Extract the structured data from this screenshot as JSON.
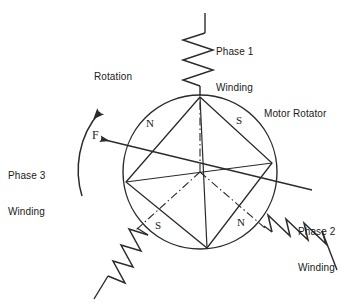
{
  "diagram": {
    "stroke_color": "#2b2b2b",
    "text_color": "#1a1a1a",
    "background": "#ffffff",
    "labels": {
      "phase1": "Phase 1\nWinding",
      "phase1_line1": "Phase 1",
      "phase1_line2": "Winding",
      "phase2_line1": "Phase 2",
      "phase2_line2": "Winding",
      "phase3_line1": "Phase 3",
      "phase3_line2": "Winding",
      "rotation": "Rotation",
      "force": "F",
      "rotator": "Motor Rotator"
    },
    "poles": {
      "north_upper_left": "N",
      "south_upper_right": "S",
      "south_lower_left": "S",
      "north_lower_right": "N"
    },
    "rotor": {
      "center_x": 200,
      "center_y": 172,
      "radius": 77,
      "vertices": [
        {
          "name": "top",
          "x": 200,
          "y": 97
        },
        {
          "name": "right",
          "x": 272,
          "y": 163
        },
        {
          "name": "bottom",
          "x": 207,
          "y": 248
        },
        {
          "name": "left",
          "x": 126,
          "y": 182
        }
      ],
      "axis_lines": [
        {
          "name": "phase1-axis",
          "angle_deg": 90
        },
        {
          "name": "phase2-axis",
          "angle_deg": -30
        },
        {
          "name": "phase3-axis",
          "angle_deg": 210
        }
      ]
    },
    "windings": [
      {
        "name": "phase-1-winding",
        "orientation": "vertical-top",
        "zigzag_count": 5
      },
      {
        "name": "phase-2-winding",
        "orientation": "diagonal-lower-right",
        "zigzag_count": 4
      },
      {
        "name": "phase-3-winding",
        "orientation": "diagonal-lower-left",
        "zigzag_count": 4
      }
    ],
    "force_arrow": {
      "name": "force-vector",
      "from_x": 312,
      "from_y": 190,
      "to_x": 96,
      "to_y": 138
    },
    "rotation_arc": {
      "name": "rotation-arrow",
      "direction": "counter-clockwise"
    }
  }
}
